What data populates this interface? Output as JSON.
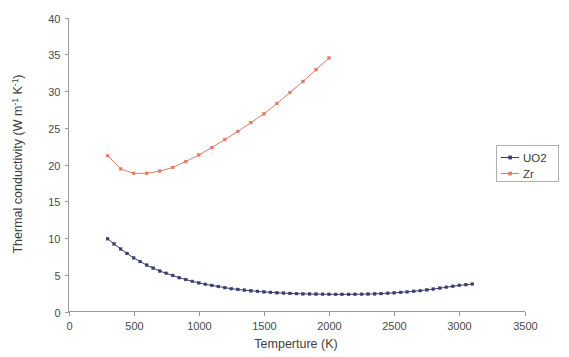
{
  "chart_data": {
    "type": "line",
    "title": "",
    "xlabel": "Temperture (K)",
    "ylabel": "Thermal conductivity (W m",
    "ylabel_sup1": "-1",
    "ylabel_mid": " K",
    "ylabel_sup2": "-1",
    "ylabel_end": ")",
    "xlim": [
      0,
      3500
    ],
    "ylim": [
      0,
      40
    ],
    "xticks": [
      0,
      500,
      1000,
      1500,
      2000,
      2500,
      3000,
      3500
    ],
    "yticks": [
      0,
      5,
      10,
      15,
      20,
      25,
      30,
      35,
      40
    ],
    "xtick_labels": [
      "0",
      "500",
      "1000",
      "1500",
      "2000",
      "2500",
      "3000",
      "3500"
    ],
    "ytick_labels": [
      "0",
      "5",
      "10",
      "15",
      "20",
      "25",
      "30",
      "35",
      "40"
    ],
    "grid": false,
    "legend_position": "right",
    "series": [
      {
        "name": "UO2",
        "color": "#3b3b6b",
        "marker": "small-square",
        "x": [
          300,
          350,
          400,
          450,
          500,
          550,
          600,
          650,
          700,
          750,
          800,
          850,
          900,
          950,
          1000,
          1050,
          1100,
          1150,
          1200,
          1250,
          1300,
          1350,
          1400,
          1450,
          1500,
          1550,
          1600,
          1650,
          1700,
          1750,
          1800,
          1850,
          1900,
          1950,
          2000,
          2050,
          2100,
          2150,
          2200,
          2250,
          2300,
          2350,
          2400,
          2450,
          2500,
          2550,
          2600,
          2650,
          2700,
          2750,
          2800,
          2850,
          2900,
          2950,
          3000,
          3050,
          3100
        ],
        "y": [
          9.9,
          9.2,
          8.5,
          7.9,
          7.3,
          6.8,
          6.3,
          5.9,
          5.5,
          5.2,
          4.9,
          4.6,
          4.35,
          4.1,
          3.9,
          3.7,
          3.55,
          3.4,
          3.25,
          3.1,
          3.0,
          2.9,
          2.82,
          2.74,
          2.67,
          2.6,
          2.55,
          2.5,
          2.46,
          2.43,
          2.4,
          2.38,
          2.36,
          2.35,
          2.34,
          2.33,
          2.33,
          2.33,
          2.34,
          2.35,
          2.37,
          2.4,
          2.44,
          2.48,
          2.54,
          2.6,
          2.67,
          2.75,
          2.84,
          2.94,
          3.05,
          3.17,
          3.3,
          3.43,
          3.56,
          3.65,
          3.72
        ]
      },
      {
        "name": "Zr",
        "color": "#e07b62",
        "marker": "small-square",
        "x": [
          300,
          400,
          500,
          600,
          700,
          800,
          900,
          1000,
          1100,
          1200,
          1300,
          1400,
          1500,
          1600,
          1700,
          1800,
          1900,
          2000
        ],
        "y": [
          21.2,
          19.4,
          18.8,
          18.8,
          19.1,
          19.6,
          20.4,
          21.3,
          22.3,
          23.4,
          24.5,
          25.7,
          26.9,
          28.3,
          29.8,
          31.3,
          32.9,
          34.5
        ]
      }
    ]
  },
  "legend": {
    "items": [
      {
        "label": "UO2",
        "color": "#3b3b6b"
      },
      {
        "label": "Zr",
        "color": "#e07b62"
      }
    ]
  },
  "colors": {
    "uo2": "#3b3b6b",
    "zr": "#e07b62",
    "axis": "#9a9a9a",
    "text": "#3a3a3a",
    "background": "#ffffff"
  }
}
